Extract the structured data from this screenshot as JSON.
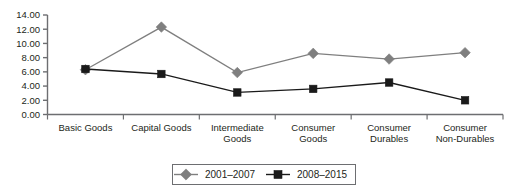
{
  "chart_data": {
    "type": "line",
    "title": "",
    "subtitle": "",
    "xlabel": "",
    "ylabel": "",
    "categories": [
      "Basic Goods",
      "Capital Goods",
      "Intermediate Goods",
      "Consumer Goods",
      "Consumer Durables",
      "Consumer Non-Durables"
    ],
    "category_lines": [
      [
        "Basic Goods"
      ],
      [
        "Capital Goods"
      ],
      [
        "Intermediate",
        "Goods"
      ],
      [
        "Consumer",
        "Goods"
      ],
      [
        "Consumer",
        "Durables"
      ],
      [
        "Consumer",
        "Non-Durables"
      ]
    ],
    "series": [
      {
        "name": "2001–2007",
        "marker": "diamond",
        "color": "#7f7f7f",
        "values": [
          6.3,
          12.3,
          5.9,
          8.6,
          7.8,
          8.7
        ]
      },
      {
        "name": "2008–2015",
        "marker": "square",
        "color": "#1a1a1a",
        "values": [
          6.4,
          5.7,
          3.1,
          3.6,
          4.5,
          2.0
        ]
      }
    ],
    "ylim": [
      0,
      14
    ],
    "ytick_step": 2,
    "ytick_labels": [
      "0.00",
      "2.00",
      "4.00",
      "6.00",
      "8.00",
      "10.00",
      "12.00",
      "14.00"
    ],
    "grid": false,
    "legend_position": "bottom"
  },
  "legend": {
    "entries": [
      {
        "label": "2001–2007",
        "marker": "diamond-marker-icon",
        "color": "#7f7f7f"
      },
      {
        "label": "2008–2015",
        "marker": "square-marker-icon",
        "color": "#1a1a1a"
      }
    ]
  },
  "colors": {
    "axis": "#6d6e71",
    "text": "#231f20",
    "series_a": "#7f7f7f",
    "series_b": "#1a1a1a",
    "legend_border": "#6d6e71",
    "background": "#ffffff"
  }
}
